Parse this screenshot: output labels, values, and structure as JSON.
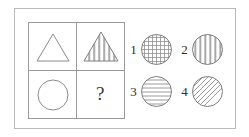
{
  "puzzle": {
    "type": "visual-analogy-matrix",
    "frame": {
      "border_color": "#b9b9b9"
    },
    "matrix": {
      "rows": 2,
      "columns": 2,
      "line_color": "#9a9a9a",
      "cells": [
        {
          "position": "top-left",
          "shape": "triangle",
          "fill": "none",
          "pattern": "plain",
          "label": ""
        },
        {
          "position": "top-right",
          "shape": "triangle",
          "fill": "striped",
          "pattern": "vertical-stripes",
          "label": ""
        },
        {
          "position": "bottom-left",
          "shape": "circle",
          "fill": "none",
          "pattern": "plain",
          "label": ""
        },
        {
          "position": "bottom-right",
          "shape": "question-mark",
          "fill": "none",
          "pattern": "unknown",
          "label": "?"
        }
      ]
    },
    "options": [
      {
        "number": "1",
        "shape": "circle",
        "pattern": "grid-crosshatch",
        "description": "circle with grid pattern"
      },
      {
        "number": "2",
        "shape": "circle",
        "pattern": "vertical-stripes",
        "description": "circle with vertical stripes"
      },
      {
        "number": "3",
        "shape": "circle",
        "pattern": "horizontal-stripes",
        "description": "circle with horizontal stripes"
      },
      {
        "number": "4",
        "shape": "circle",
        "pattern": "diagonal-stripes",
        "description": "circle with diagonal stripes"
      }
    ],
    "colors": {
      "background": "#ffffff",
      "stroke": "#8c8c8c",
      "text": "#2e2e2e"
    }
  }
}
